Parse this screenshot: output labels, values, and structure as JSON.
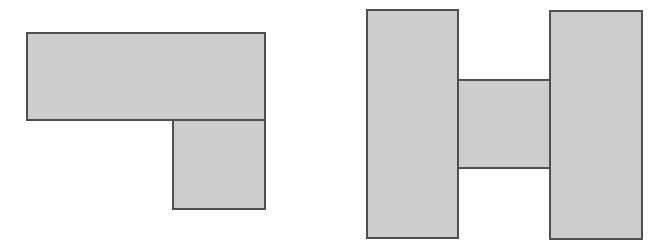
{
  "colors": {
    "fill": "#cdcdcd",
    "stroke": "#4f4f4f",
    "background": "#ffffff"
  },
  "figures": [
    {
      "name": "l-shape",
      "parts": [
        {
          "name": "top-bar",
          "x": 26,
          "y": 32,
          "w": 240,
          "h": 89
        },
        {
          "name": "bottom-square",
          "x": 172,
          "y": 119,
          "w": 94,
          "h": 91
        }
      ]
    },
    {
      "name": "h-shape",
      "parts": [
        {
          "name": "left-bar",
          "x": 366,
          "y": 9,
          "w": 93,
          "h": 230
        },
        {
          "name": "middle-bar",
          "x": 457,
          "y": 79,
          "w": 94,
          "h": 90
        },
        {
          "name": "right-bar",
          "x": 549,
          "y": 10,
          "w": 94,
          "h": 230
        }
      ]
    }
  ]
}
